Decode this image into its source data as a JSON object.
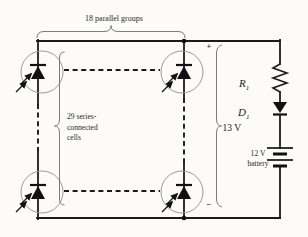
{
  "figure_type": "solar-array-battery-charger-circuit-diagram",
  "colors": {
    "background": "#fcfbf8",
    "line": "#1b1b1b",
    "cell_circle": "#9a9a9a",
    "brace": "#7c7c7c",
    "text": "#2a2a2a"
  },
  "labels": {
    "parallel_groups": "18 parallel groups",
    "series_cells": [
      "29 series-",
      "connected",
      "cells"
    ],
    "plus": "+",
    "minus": "−",
    "array_voltage": "13 V",
    "resistor": {
      "base": "R",
      "sub": "1"
    },
    "diode": {
      "base": "D",
      "sub": "1"
    },
    "battery": [
      "12 V",
      "battery"
    ]
  }
}
